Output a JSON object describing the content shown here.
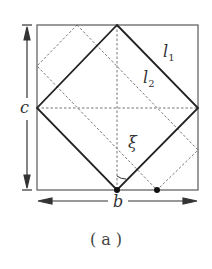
{
  "figure": {
    "caption": "( a )",
    "labels": {
      "l1_main": "l",
      "l1_sub": "1",
      "l2_main": "l",
      "l2_sub": "2",
      "c": "c",
      "b": "b",
      "xi": "ξ"
    },
    "colors": {
      "solid": "#222222",
      "dotted": "#555555",
      "box": "#666666"
    }
  }
}
